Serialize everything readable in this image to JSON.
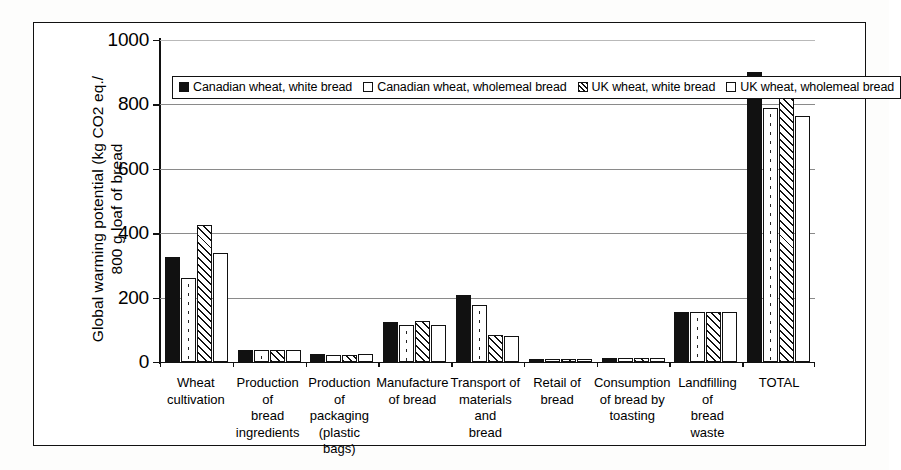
{
  "chart_data": {
    "type": "bar",
    "title": "",
    "subtitle": "",
    "xlabel": "",
    "ylabel_lines": [
      "Global warming potential (kg CO2 eq./",
      "800 g loaf of bread"
    ],
    "ylabel": "Global warming potential (kg CO2 eq./800 g loaf of bread",
    "ylim": [
      0,
      1000
    ],
    "yticks": [
      0,
      200,
      400,
      600,
      800,
      1000
    ],
    "ytick_labels": [
      "0",
      "200",
      "400",
      "600",
      "800",
      "1000"
    ],
    "grid": "horizontal",
    "legend_position": "top-left-inside",
    "categories": [
      [
        "Wheat",
        "cultivation"
      ],
      [
        "Production of",
        "bread",
        "ingredients"
      ],
      [
        "Production of",
        "packaging",
        "(plastic bags)"
      ],
      [
        "Manufacture",
        "of bread"
      ],
      [
        "Transport of",
        "materials and",
        "bread"
      ],
      [
        "Retail of",
        "bread"
      ],
      [
        "Consumption",
        "of bread by",
        "toasting"
      ],
      [
        "Landfilling of",
        "bread waste"
      ],
      [
        "TOTAL"
      ]
    ],
    "series": [
      {
        "name": "Canadian wheat, white bread",
        "pattern": "solid-black",
        "color": "#111111",
        "values": [
          327,
          38,
          24,
          124,
          208,
          10,
          12,
          155,
          900
        ]
      },
      {
        "name": "Canadian wheat, wholemeal bread",
        "pattern": "white-dotted",
        "color": "#ffffff",
        "values": [
          262,
          38,
          22,
          114,
          178,
          10,
          11,
          155,
          790
        ]
      },
      {
        "name": "UK wheat, white bread",
        "pattern": "diagonal-hatch",
        "color": "#ffffff",
        "values": [
          425,
          38,
          22,
          126,
          85,
          10,
          12,
          155,
          870
        ]
      },
      {
        "name": "UK wheat, wholemeal bread",
        "pattern": "white-plain",
        "color": "#ffffff",
        "values": [
          338,
          38,
          24,
          115,
          80,
          10,
          11,
          155,
          765
        ]
      }
    ]
  }
}
